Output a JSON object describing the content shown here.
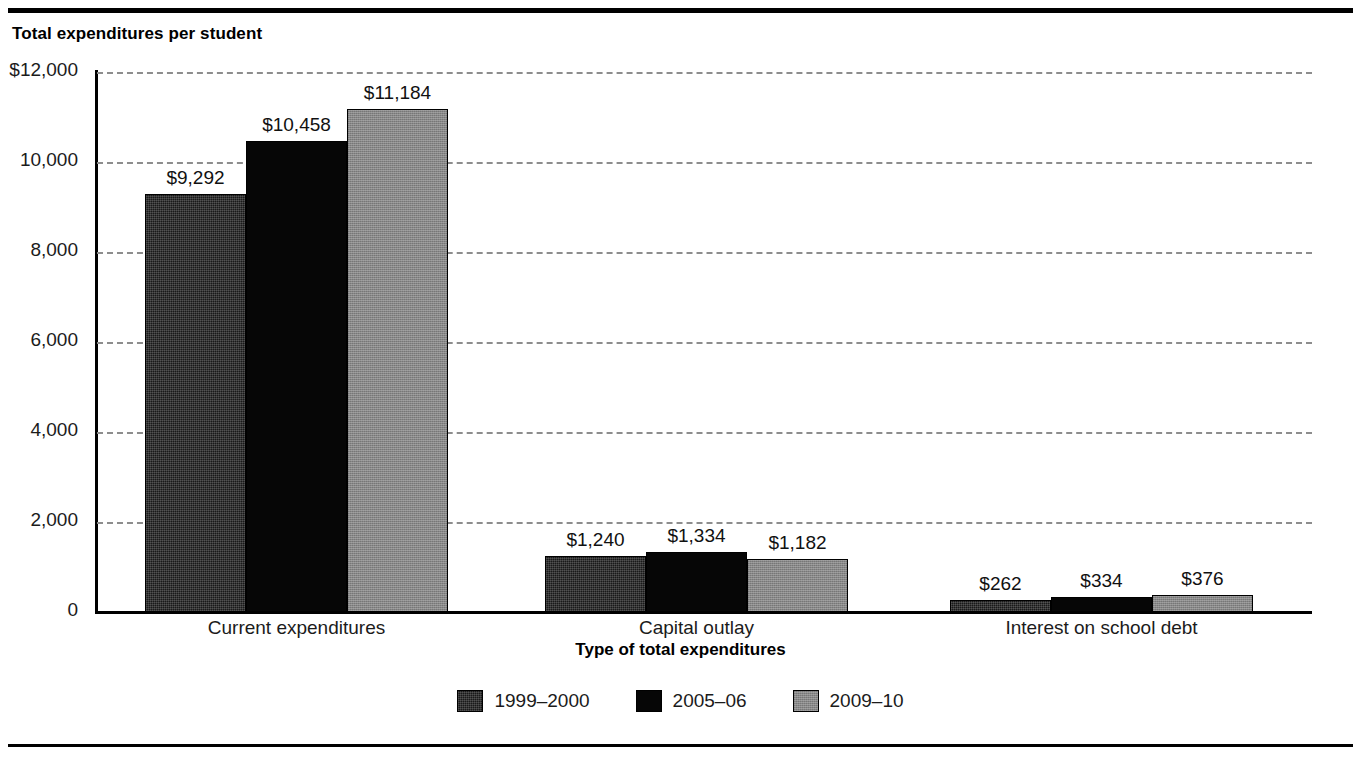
{
  "chart_title": "Total expenditures per student",
  "chart_data": {
    "type": "bar",
    "title": "Total expenditures per student",
    "xlabel": "Type of total expenditures",
    "ylabel": "",
    "ylim": [
      0,
      12000
    ],
    "ytick_values": [
      12000,
      10000,
      8000,
      6000,
      4000,
      2000,
      0
    ],
    "ytick_labels": [
      "$12,000",
      "10,000",
      "8,000",
      "6,000",
      "4,000",
      "2,000",
      "0"
    ],
    "grid": "horizontal-dashed",
    "legend_position": "bottom-center",
    "categories": [
      "Current expenditures",
      "Capital outlay",
      "Interest on school debt"
    ],
    "series": [
      {
        "name": "1999–2000",
        "color": "#191919",
        "values": [
          9292,
          1240,
          262
        ],
        "labels": [
          "$9,292",
          "$1,240",
          "$262"
        ]
      },
      {
        "name": "2005–06",
        "color": "#060606",
        "values": [
          10458,
          1334,
          334
        ],
        "labels": [
          "$10,458",
          "$1,334",
          "$334"
        ]
      },
      {
        "name": "2009–10",
        "color": "#878787",
        "values": [
          11184,
          1182,
          376
        ],
        "labels": [
          "$11,184",
          "$1,182",
          "$376"
        ]
      }
    ]
  },
  "legend": {
    "items": [
      {
        "label": "1999–2000",
        "swatch_class": "sw-1999"
      },
      {
        "label": "2005–06",
        "swatch_class": "sw-2005"
      },
      {
        "label": "2009–10",
        "swatch_class": "sw-2009"
      }
    ]
  }
}
